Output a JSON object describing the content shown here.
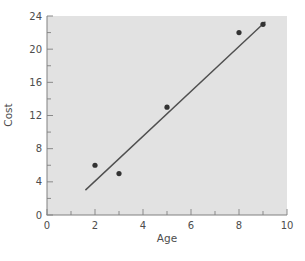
{
  "figure": {
    "background_color": "#ffffff",
    "plot_background_color": "#e2e2e2",
    "axis_color": "#808080",
    "tick_color": "#8a8a8a",
    "text_color": "#4d4d4d",
    "point_color": "#333333",
    "trend_line_color": "#4f4f4f"
  },
  "chart_data": {
    "type": "scatter",
    "title": "",
    "xlabel": "Age",
    "ylabel": "Cost",
    "xlim": [
      0,
      10
    ],
    "ylim": [
      0,
      24
    ],
    "x_major_ticks": [
      0,
      2,
      4,
      6,
      8,
      10
    ],
    "x_minor_ticks": [
      1,
      3,
      5,
      7,
      9
    ],
    "y_major_ticks": [
      0,
      4,
      8,
      12,
      16,
      20,
      24
    ],
    "y_minor_ticks": [
      2,
      6,
      10,
      14,
      18,
      22
    ],
    "points": [
      [
        2,
        6
      ],
      [
        3,
        5
      ],
      [
        5,
        13
      ],
      [
        8,
        22
      ],
      [
        9,
        23
      ]
    ],
    "trend_line": {
      "x1": 1.6,
      "y1": 3.0,
      "x2": 9.1,
      "y2": 23.3
    },
    "grid": false,
    "legend": null
  }
}
